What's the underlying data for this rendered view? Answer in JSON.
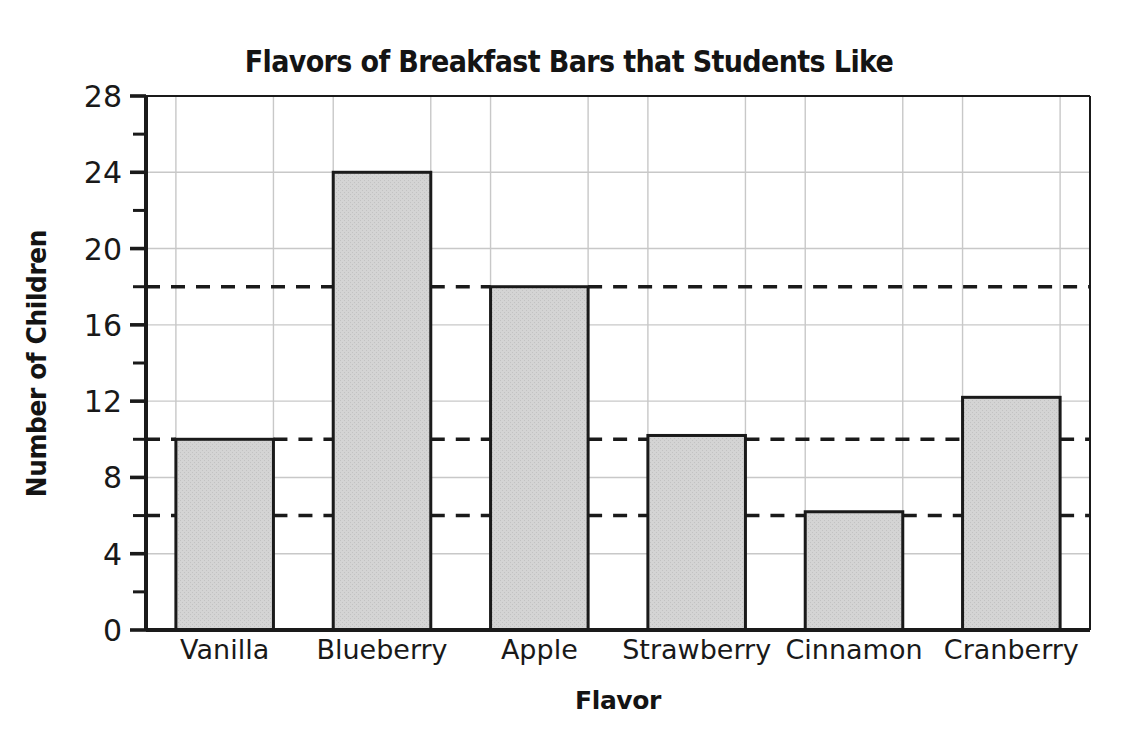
{
  "chart_data": {
    "type": "bar",
    "title": "Flavors of Breakfast Bars that Students Like",
    "xlabel": "Flavor",
    "ylabel": "Number of Children",
    "categories": [
      "Vanilla",
      "Blueberry",
      "Apple",
      "Strawberry",
      "Cinnamon",
      "Cranberry"
    ],
    "values": [
      10,
      24,
      18,
      10.2,
      6.2,
      12.2
    ],
    "ylim": [
      0,
      28
    ],
    "y_tick_labels": [
      0,
      4,
      8,
      12,
      16,
      20,
      24,
      28
    ],
    "y_minor_ticks": [
      2,
      6,
      10,
      14,
      18,
      22,
      26
    ],
    "y_major_step": 4,
    "y_minor_step": 2,
    "gridlines": [
      4,
      8,
      12,
      16,
      20,
      24,
      28
    ],
    "dashed_reference_lines": [
      6,
      10,
      18
    ],
    "grid": true,
    "legend": "none",
    "bar_fill_color": "#d2d2d2",
    "bar_edge_color": "#1a1a1a",
    "gridline_color": "#c8c8c8",
    "axis_color": "#1a1a1a",
    "dashed_line_color": "#1a1a1a",
    "background_color": "#ffffff"
  },
  "axes": {
    "y_axis_name": "y-axis",
    "x_axis_name": "x-axis"
  }
}
